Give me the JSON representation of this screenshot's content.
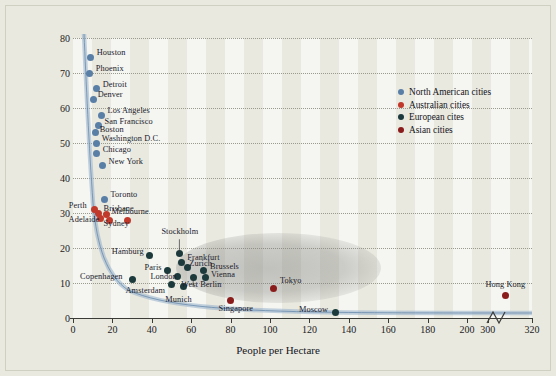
{
  "chart_data": {
    "type": "scatter",
    "title": "",
    "xlabel": "People per Hectare",
    "ylabel": "Annual Petrol Consumption per Capita (Gigajoules)",
    "xlim": [
      0,
      320
    ],
    "ylim": [
      0,
      80
    ],
    "xticks": [
      0,
      20,
      40,
      60,
      80,
      100,
      120,
      140,
      160,
      180,
      200,
      300,
      320
    ],
    "yticks": [
      0,
      10,
      20,
      30,
      40,
      50,
      60,
      70,
      80
    ],
    "grid": "horizontal-dotted",
    "axis_break": {
      "after": 200,
      "before": 300
    },
    "legend_position": "top-right",
    "series": [
      {
        "name": "North American cities",
        "color": "#5a7fa6",
        "points": [
          {
            "label": "Houston",
            "x": 9,
            "y": 74.5
          },
          {
            "label": "Phoenix",
            "x": 8.5,
            "y": 70
          },
          {
            "label": "Detroit",
            "x": 12,
            "y": 65.5
          },
          {
            "label": "Denver",
            "x": 10.5,
            "y": 62.5
          },
          {
            "label": "Los Angeles",
            "x": 14.5,
            "y": 58
          },
          {
            "label": "San Francisco",
            "x": 13,
            "y": 55
          },
          {
            "label": "Boston",
            "x": 11.5,
            "y": 53
          },
          {
            "label": "Washington D.C.",
            "x": 12,
            "y": 50
          },
          {
            "label": "Chicago",
            "x": 12,
            "y": 47
          },
          {
            "label": "New York",
            "x": 15,
            "y": 43.5
          },
          {
            "label": "Toronto",
            "x": 16,
            "y": 34
          }
        ]
      },
      {
        "name": "Australian cities",
        "color": "#c0392b",
        "points": [
          {
            "label": "Perth",
            "x": 11,
            "y": 31
          },
          {
            "label": "Brisbane",
            "x": 13,
            "y": 30
          },
          {
            "label": "Melbourne",
            "x": 17,
            "y": 29.5
          },
          {
            "label": "Adelaide",
            "x": 14,
            "y": 28.5
          },
          {
            "label": "Sydney",
            "x": 18.5,
            "y": 28
          },
          {
            "label": "",
            "x": 27.5,
            "y": 28
          }
        ]
      },
      {
        "name": "European cites",
        "color": "#1c3a3c",
        "points": [
          {
            "label": "Stockholm",
            "x": 54,
            "y": 18.5
          },
          {
            "label": "Frankfurt",
            "x": 55,
            "y": 16
          },
          {
            "label": "Hamburg",
            "x": 39,
            "y": 18
          },
          {
            "label": "Zurich",
            "x": 58,
            "y": 14.5
          },
          {
            "label": "Brussels",
            "x": 66,
            "y": 13.5
          },
          {
            "label": "Paris",
            "x": 48,
            "y": 13.5
          },
          {
            "label": "London",
            "x": 53,
            "y": 12
          },
          {
            "label": "Vienna",
            "x": 67,
            "y": 11.5
          },
          {
            "label": "Copenhagen",
            "x": 30,
            "y": 11
          },
          {
            "label": "West Berlin",
            "x": 61,
            "y": 11.5
          },
          {
            "label": "Amsterdam",
            "x": 50,
            "y": 9.5
          },
          {
            "label": "Munich",
            "x": 56,
            "y": 9
          },
          {
            "label": "Moscow",
            "x": 133,
            "y": 1.5
          }
        ]
      },
      {
        "name": "Asian cities",
        "color": "#8b1c1c",
        "points": [
          {
            "label": "Tokyo",
            "x": 102,
            "y": 8.5
          },
          {
            "label": "Singapore",
            "x": 80,
            "y": 5
          },
          {
            "label": "Hong Kong",
            "x": 308,
            "y": 6.5
          }
        ]
      }
    ]
  },
  "legend": {
    "items": [
      {
        "label": "North American cities",
        "color": "#5a7fa6"
      },
      {
        "label": "Australian cities",
        "color": "#c0392b"
      },
      {
        "label": "European cites",
        "color": "#1c3a3c"
      },
      {
        "label": "Asian cities",
        "color": "#8b1c1c"
      }
    ]
  }
}
